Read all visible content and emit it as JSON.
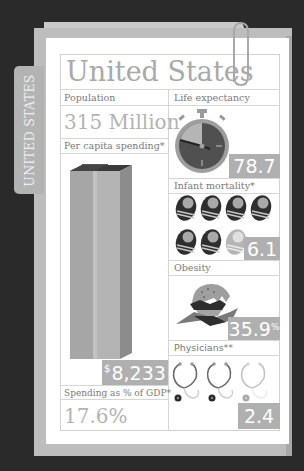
{
  "folder": {
    "tab_label": "UNITED STATES"
  },
  "card": {
    "title": "United States",
    "population": {
      "label": "Population",
      "value": "315 Million"
    },
    "per_capita_spending": {
      "label": "Per capita spending*",
      "currency_symbol": "$",
      "value": "8,233"
    },
    "spending_gdp": {
      "label": "Spending as % of GDP*",
      "value": "17.6%"
    },
    "life_expectancy": {
      "label": "Life expectancy",
      "value": "78.7"
    },
    "infant_mortality": {
      "label": "Infant mortality*",
      "value": "6.1"
    },
    "obesity": {
      "label": "Obesity",
      "value": "35.9",
      "unit": "%"
    },
    "physicians": {
      "label": "Physicians**",
      "value": "2.4"
    }
  },
  "colors": {
    "background": "#2a2a2a",
    "folder": "#bdbdbd",
    "paper": "#ffffff",
    "stat_box": "#b0b0b0",
    "title_text": "#a9a9a9",
    "dark_icon": "#3a3a3a"
  }
}
